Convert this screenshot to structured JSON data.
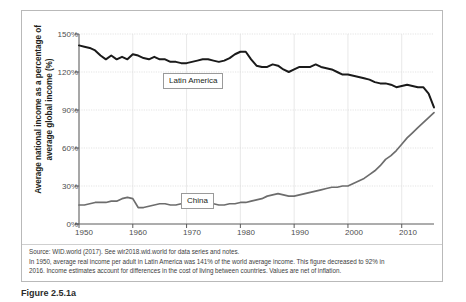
{
  "chart_data": {
    "type": "line",
    "title": "",
    "xlabel": "",
    "ylabel": "Average national income as a percentage of average global income (%)",
    "xlim": [
      1950,
      2016
    ],
    "ylim": [
      0,
      150
    ],
    "y_ticks": [
      "0%",
      "30%",
      "60%",
      "90%",
      "120%",
      "150%"
    ],
    "y_tick_values": [
      0,
      30,
      60,
      90,
      120,
      150
    ],
    "x_ticks": [
      "1950",
      "1960",
      "1970",
      "1980",
      "1990",
      "2000",
      "2010"
    ],
    "x_tick_values": [
      1950,
      1960,
      1970,
      1980,
      1990,
      2000,
      2010
    ],
    "grid": true,
    "legend": "inline-labels",
    "series": [
      {
        "name": "Latin America",
        "color": "#1a1a1a",
        "x": [
          1950,
          1951,
          1952,
          1953,
          1954,
          1955,
          1956,
          1957,
          1958,
          1959,
          1960,
          1961,
          1962,
          1963,
          1964,
          1965,
          1966,
          1967,
          1968,
          1969,
          1970,
          1971,
          1972,
          1973,
          1974,
          1975,
          1976,
          1977,
          1978,
          1979,
          1980,
          1981,
          1982,
          1983,
          1984,
          1985,
          1986,
          1987,
          1988,
          1989,
          1990,
          1991,
          1992,
          1993,
          1994,
          1995,
          1996,
          1997,
          1998,
          1999,
          2000,
          2001,
          2002,
          2003,
          2004,
          2005,
          2006,
          2007,
          2008,
          2009,
          2010,
          2011,
          2012,
          2013,
          2014,
          2015,
          2016
        ],
        "values": [
          141,
          140,
          139,
          137,
          133,
          130,
          133,
          130,
          132,
          130,
          134,
          133,
          131,
          130,
          132,
          130,
          130,
          128,
          128,
          127,
          127,
          128,
          129,
          130,
          130,
          129,
          128,
          129,
          131,
          134,
          136,
          136,
          130,
          125,
          124,
          124,
          126,
          125,
          122,
          120,
          122,
          124,
          124,
          124,
          126,
          124,
          123,
          122,
          120,
          118,
          118,
          117,
          116,
          115,
          114,
          112,
          111,
          111,
          110,
          108,
          109,
          110,
          109,
          108,
          108,
          103,
          92
        ]
      },
      {
        "name": "China",
        "color": "#6d6d6d",
        "x": [
          1950,
          1951,
          1952,
          1953,
          1954,
          1955,
          1956,
          1957,
          1958,
          1959,
          1960,
          1961,
          1962,
          1963,
          1964,
          1965,
          1966,
          1967,
          1968,
          1969,
          1970,
          1971,
          1972,
          1973,
          1974,
          1975,
          1976,
          1977,
          1978,
          1979,
          1980,
          1981,
          1982,
          1983,
          1984,
          1985,
          1986,
          1987,
          1988,
          1989,
          1990,
          1991,
          1992,
          1993,
          1994,
          1995,
          1996,
          1997,
          1998,
          1999,
          2000,
          2001,
          2002,
          2003,
          2004,
          2005,
          2006,
          2007,
          2008,
          2009,
          2010,
          2011,
          2012,
          2013,
          2014,
          2015,
          2016
        ],
        "values": [
          15,
          15,
          16,
          17,
          17,
          17,
          18,
          18,
          20,
          21,
          20,
          13,
          13,
          14,
          15,
          16,
          16,
          15,
          15,
          16,
          16,
          16,
          16,
          16,
          16,
          16,
          15,
          15,
          16,
          16,
          17,
          17,
          18,
          19,
          20,
          22,
          23,
          24,
          23,
          22,
          22,
          23,
          24,
          25,
          26,
          27,
          28,
          29,
          29,
          30,
          30,
          32,
          34,
          36,
          39,
          42,
          46,
          51,
          54,
          58,
          63,
          68,
          72,
          76,
          80,
          84,
          88
        ]
      }
    ],
    "annotations": [
      {
        "text": "Latin America",
        "x": 1975,
        "y": 118
      },
      {
        "text": "China",
        "x": 1970,
        "y": 33
      }
    ]
  },
  "notes": {
    "line1": "Source: WID.world (2017). See wir2018.wid.world for data series and notes.",
    "line2": "In 1950, average real income per adult in Latin America was 141% of the world average income. This figure decreased to 92% in",
    "line3": "2016. Income estimates account for differences in the cost of living between countries. Values are net of inflation."
  },
  "caption": {
    "text": "Figure 2.5.1a"
  }
}
